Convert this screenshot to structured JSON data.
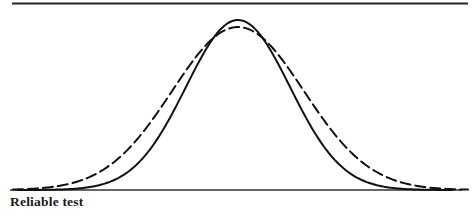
{
  "figure": {
    "caption": "Reliable test",
    "background_color": "#ffffff",
    "ink_color": "#111111",
    "width": 476,
    "height": 215
  },
  "chart_data": {
    "type": "line",
    "title": "",
    "subtitle": "",
    "xlabel": "",
    "ylabel": "",
    "caption": "Reliable test",
    "grid": false,
    "legend_position": "none",
    "axis": {
      "baseline_y": 190,
      "baseline_x_start": 10,
      "baseline_x_end": 462,
      "top_rule_y": 3,
      "top_rule_x_start": 12,
      "top_rule_x_end": 468,
      "xlim": [
        0,
        476
      ],
      "ylim": [
        0,
        1
      ],
      "tick_labels_x": [],
      "tick_labels_y": []
    },
    "annotations": [
      {
        "text": "Reliable test",
        "x": 10,
        "y": 205,
        "style": "bold-serif"
      }
    ],
    "series": [
      {
        "name": "solid-narrow-distribution",
        "style": "solid",
        "stroke_width": 2.0,
        "color": "#111111",
        "description": "Narrower normal curve with taller peak (reliable test)",
        "mean": 238,
        "sigma": 52,
        "peak_x": 238,
        "peak_y": 20,
        "amplitude": 170,
        "x_start": 18,
        "x_end": 452,
        "x": [
          18,
          40,
          62,
          84,
          106,
          128,
          150,
          172,
          190,
          206,
          222,
          238,
          254,
          270,
          285,
          305,
          327,
          349,
          371,
          393,
          415,
          437,
          452
        ],
        "values": [
          0.002,
          0.008,
          0.021,
          0.048,
          0.097,
          0.173,
          0.278,
          0.407,
          0.511,
          0.654,
          0.884,
          1.0,
          0.884,
          0.654,
          0.511,
          0.326,
          0.2,
          0.112,
          0.057,
          0.026,
          0.011,
          0.004,
          0.002
        ]
      },
      {
        "name": "dashed-wide-distribution",
        "style": "dashed",
        "dash_length": 10,
        "gap_length": 5,
        "stroke_width": 2.0,
        "color": "#111111",
        "description": "Wider, flatter normal curve with lower peak and fatter tails",
        "mean": 238,
        "sigma": 66,
        "peak_x": 238,
        "peak_y": 27,
        "amplitude": 163,
        "x_start": 13,
        "x_end": 468,
        "x": [
          13,
          40,
          62,
          84,
          106,
          128,
          150,
          172,
          190,
          206,
          222,
          238,
          254,
          270,
          285,
          305,
          327,
          349,
          371,
          393,
          415,
          437,
          468
        ],
        "values": [
          0.012,
          0.032,
          0.064,
          0.112,
          0.182,
          0.273,
          0.381,
          0.497,
          0.585,
          0.74,
          0.926,
          1.0,
          0.926,
          0.74,
          0.585,
          0.42,
          0.296,
          0.195,
          0.12,
          0.069,
          0.037,
          0.018,
          0.005
        ]
      }
    ],
    "crossover_points": [
      {
        "x": 190,
        "y": 50
      },
      {
        "x": 285,
        "y": 50
      }
    ]
  }
}
